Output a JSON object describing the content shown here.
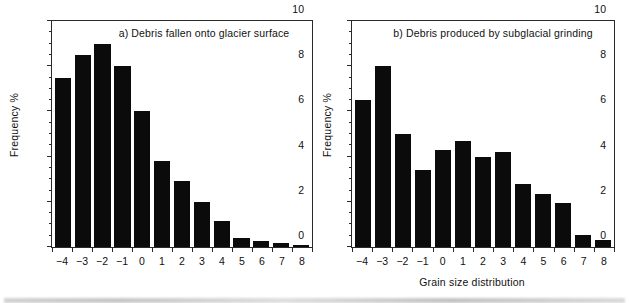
{
  "figure": {
    "background_color": "#ffffff",
    "bar_color": "#0b0b0b",
    "axis_color": "#2a2a2a",
    "xlabel": "Grain size distribution"
  },
  "panels": [
    {
      "id": "a",
      "title": "a) Debris fallen onto glacier surface",
      "ylabel": "Frequency %"
    },
    {
      "id": "b",
      "title": "b) Debris produced by subglacial grinding",
      "ylabel": "Frequency %"
    }
  ],
  "axis": {
    "y_major_ticks": [
      "0",
      "2",
      "4",
      "6",
      "8",
      "10"
    ],
    "x_tick_labels": [
      "−4",
      "−3",
      "−2",
      "−1",
      "0",
      "1",
      "2",
      "3",
      "4",
      "5",
      "6",
      "7",
      "8"
    ]
  },
  "chart_data": [
    {
      "type": "bar",
      "title": "a) Debris fallen onto glacier surface",
      "xlabel": "Grain size distribution",
      "ylabel": "Frequency %",
      "categories": [
        "-4",
        "-3",
        "-2",
        "-1",
        "0",
        "1",
        "2",
        "3",
        "4",
        "5",
        "6",
        "7",
        "8"
      ],
      "values": [
        7.5,
        8.5,
        9.0,
        8.0,
        6.0,
        3.8,
        2.9,
        2.0,
        1.15,
        0.4,
        0.28,
        0.17,
        0.08
      ],
      "ylim": [
        0,
        10
      ],
      "yticks": [
        0,
        2,
        4,
        6,
        8,
        10
      ],
      "y_minor_tick_step": 0.5,
      "grid": false,
      "legend": null
    },
    {
      "type": "bar",
      "title": "b) Debris produced by subglacial grinding",
      "xlabel": "Grain size distribution",
      "ylabel": "Frequency %",
      "categories": [
        "-4",
        "-3",
        "-2",
        "-1",
        "0",
        "1",
        "2",
        "3",
        "4",
        "5",
        "6",
        "7",
        "8"
      ],
      "values": [
        6.5,
        8.0,
        5.0,
        3.4,
        4.3,
        4.7,
        4.0,
        4.2,
        2.8,
        2.35,
        1.95,
        0.52,
        0.3
      ],
      "ylim": [
        0,
        10
      ],
      "yticks": [
        0,
        2,
        4,
        6,
        8,
        10
      ],
      "y_minor_tick_step": 0.5,
      "grid": false,
      "legend": null
    }
  ]
}
